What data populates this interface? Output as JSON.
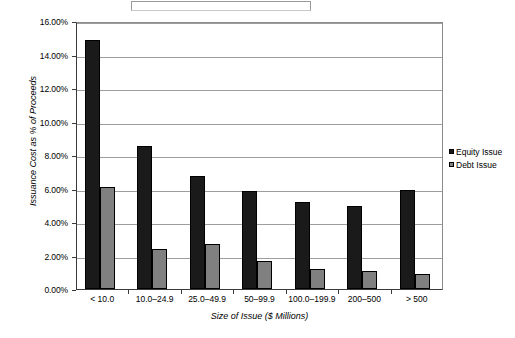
{
  "chart_data": {
    "type": "bar",
    "title": "",
    "xlabel": "Size of Issue ($ Millions)",
    "ylabel": "Issuance Cost as % of Proceeds",
    "categories": [
      "< 10.0",
      "10.0–24.9",
      "25.0–49.9",
      "50–99.9",
      "100.0–199.9",
      "200–500",
      "> 500"
    ],
    "series": [
      {
        "name": "Equity Issue",
        "color": "#1a1a1a",
        "values": [
          14.85,
          8.55,
          6.75,
          5.85,
          5.2,
          4.95,
          5.9
        ]
      },
      {
        "name": "Debt Issue",
        "color": "#808080",
        "values": [
          6.1,
          2.4,
          2.7,
          1.65,
          1.2,
          1.1,
          0.9
        ]
      }
    ],
    "ylim": [
      0,
      16
    ],
    "ytick_values": [
      0,
      2,
      4,
      6,
      8,
      10,
      12,
      14,
      16
    ],
    "ytick_labels": [
      "0.00%",
      "2.00%",
      "4.00%",
      "6.00%",
      "8.00%",
      "10.00%",
      "12.00%",
      "14.00%",
      "16.00%"
    ],
    "grid": true,
    "legend_position": "right"
  },
  "legend": {
    "items": [
      {
        "label": "Equity Issue",
        "swatch": "equity"
      },
      {
        "label": "Debt Issue",
        "swatch": "debt"
      }
    ]
  }
}
